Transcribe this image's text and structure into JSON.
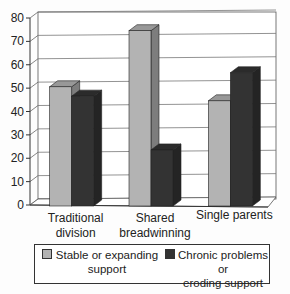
{
  "chart_data": {
    "type": "bar",
    "style": "3d-clustered-column",
    "title": "",
    "xlabel": "",
    "ylabel": "",
    "ylim": [
      0,
      80
    ],
    "yticks": [
      0,
      10,
      20,
      30,
      40,
      50,
      60,
      70,
      80
    ],
    "grid": true,
    "legend_position": "bottom",
    "categories": [
      "Traditional division",
      "Shared breadwinning",
      "Single parents"
    ],
    "category_lines": [
      [
        "Traditional",
        "division"
      ],
      [
        "Shared",
        "breadwinning"
      ],
      [
        "Single parents"
      ]
    ],
    "series": [
      {
        "name": "Stable or expanding support",
        "color": "#b3b3b3",
        "values": [
          51,
          75,
          45
        ]
      },
      {
        "name": "Chronic problems or eroding support",
        "color": "#333333",
        "values": [
          47,
          24,
          57
        ]
      }
    ]
  },
  "legend": {
    "items": [
      {
        "line1": "Stable or expanding",
        "line2": "support",
        "color": "#b3b3b3"
      },
      {
        "line1": "Chronic problems or",
        "line2": "eroding support",
        "color": "#333333"
      }
    ]
  }
}
